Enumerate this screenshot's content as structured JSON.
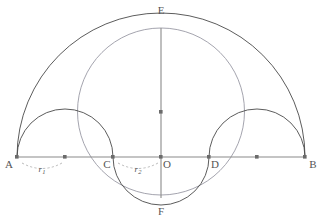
{
  "figure": {
    "canvas": {
      "width": 323,
      "height": 221,
      "background": "#ffffff"
    },
    "colors": {
      "arc_dark": "#4a4a4a",
      "arc_light": "#9a9aa5",
      "axis": "#8a8a8a",
      "point": "#6b6b6b",
      "label": "#555555",
      "dashed": "#aaaaaa"
    },
    "points": [
      {
        "id": "A",
        "label": "A",
        "x": 17,
        "y": 157,
        "label_x": 9,
        "label_y": 168,
        "dot": true
      },
      {
        "id": "C",
        "label": "C",
        "x": 113,
        "y": 157,
        "label_x": 105,
        "label_y": 168,
        "dot": true
      },
      {
        "id": "O",
        "label": "O",
        "x": 161,
        "y": 157,
        "label_x": 164,
        "label_y": 168,
        "dot": true
      },
      {
        "id": "D",
        "label": "D",
        "x": 209,
        "y": 157,
        "label_x": 212,
        "label_y": 168,
        "dot": true
      },
      {
        "id": "B",
        "label": "B",
        "x": 305,
        "y": 157,
        "label_x": 310,
        "label_y": 168,
        "dot": true
      },
      {
        "id": "E",
        "label": "E",
        "x": 161,
        "y": 28,
        "label_x": 157,
        "label_y": 12,
        "dot": false
      },
      {
        "id": "F",
        "label": "F",
        "x": 161,
        "y": 195,
        "label_x": 157,
        "label_y": 213,
        "dot": false
      }
    ],
    "center_dots": [
      {
        "id": "center-AC",
        "x": 65,
        "y": 157
      },
      {
        "id": "center-DB",
        "x": 257,
        "y": 157
      },
      {
        "id": "center-vertical",
        "x": 161,
        "y": 112
      }
    ],
    "measures": [
      {
        "id": "r1",
        "base": "r",
        "sub": "1",
        "label_x": 47,
        "label_y": 170,
        "from_x": 22,
        "to_x": 62
      },
      {
        "id": "r2",
        "base": "r",
        "sub": "2",
        "label_x": 140,
        "label_y": 170,
        "from_x": 118,
        "to_x": 156
      }
    ],
    "segments": {
      "baseline": {
        "x1": 17,
        "y1": 157,
        "x2": 305,
        "y2": 157
      },
      "vertical": {
        "x1": 161,
        "y1": 28,
        "x2": 161,
        "y2": 198
      }
    },
    "arcs": {
      "outer_semicircle_AB": {
        "cx": 161,
        "cy": 157,
        "r": 144,
        "style": "dark"
      },
      "semicircle_AC": {
        "cx": 65,
        "cy": 157,
        "r": 48,
        "style": "dark"
      },
      "semicircle_DB": {
        "cx": 257,
        "cy": 157,
        "r": 48,
        "style": "dark"
      },
      "semicircle_CD_lower": {
        "cx": 161,
        "cy": 157,
        "r": 48,
        "style": "dark"
      },
      "circle_EF": {
        "cx": 161,
        "cy": 111.5,
        "r": 83.5,
        "style": "light"
      }
    }
  }
}
